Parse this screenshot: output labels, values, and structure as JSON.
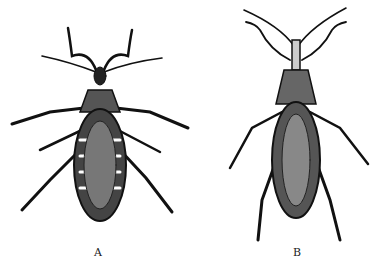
{
  "figure": {
    "panels": [
      {
        "label": "A",
        "subject": "insect-dorsal-view"
      },
      {
        "label": "B",
        "subject": "insect-dorsal-view"
      }
    ]
  }
}
